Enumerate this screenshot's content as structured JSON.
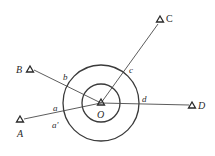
{
  "diagram": {
    "type": "survey-station-directions",
    "center": {
      "label": "O",
      "x": 101,
      "y": 103
    },
    "circles": [
      {
        "name": "inner-circle",
        "r": 19
      },
      {
        "name": "outer-circle",
        "r": 38
      }
    ],
    "stations": [
      {
        "id": "A",
        "label": "A",
        "x": 20,
        "y": 120,
        "label_x": 17,
        "label_y": 137
      },
      {
        "id": "B",
        "label": "B",
        "x": 30,
        "y": 69,
        "label_x": 16,
        "label_y": 73
      },
      {
        "id": "C",
        "label": "C",
        "x": 161,
        "y": 19,
        "label_x": 166,
        "label_y": 22
      },
      {
        "id": "D",
        "label": "D",
        "x": 193,
        "y": 105,
        "label_x": 199,
        "label_y": 109
      }
    ],
    "intersection_labels": [
      {
        "label": "a",
        "x": 53,
        "y": 111
      },
      {
        "label": "a'",
        "x": 52,
        "y": 128
      },
      {
        "label": "b",
        "x": 63,
        "y": 80
      },
      {
        "label": "c",
        "x": 129,
        "y": 73
      },
      {
        "label": "d",
        "x": 142,
        "y": 102
      }
    ],
    "colors": {
      "line": "#3a3a3a",
      "text": "#2a2a2a",
      "background": "#ffffff"
    }
  }
}
